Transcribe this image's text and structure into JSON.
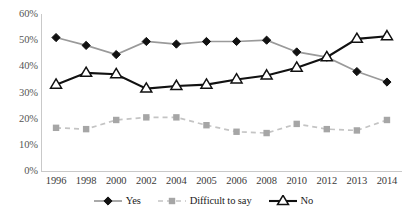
{
  "chart_data": {
    "type": "line",
    "title": "",
    "xlabel": "",
    "ylabel": "",
    "grid": false,
    "legend_position": "bottom",
    "ylim": [
      0,
      60
    ],
    "ytick_labels": [
      "0%",
      "10%",
      "20%",
      "30%",
      "40%",
      "50%",
      "60%"
    ],
    "ytick_values": [
      0,
      10,
      20,
      30,
      40,
      50,
      60
    ],
    "categories": [
      "1996",
      "1998",
      "2000",
      "2002",
      "2004",
      "2005",
      "2006",
      "2008",
      "2010",
      "2012",
      "2013",
      "2014"
    ],
    "series": [
      {
        "name": "Yes",
        "marker": "diamond",
        "marker_fill": "#111111",
        "line_color": "#9a9a9a",
        "values": [
          51,
          48,
          44.5,
          49.5,
          48.5,
          49.5,
          49.5,
          50,
          45.5,
          43.5,
          38,
          34
        ]
      },
      {
        "name": "Difficult to say",
        "marker": "square",
        "marker_fill": "#a6a6a6",
        "line_color": "#c4c4c4",
        "line_style": "dashed",
        "values": [
          16.5,
          16,
          19.5,
          20.5,
          20.5,
          17.5,
          15,
          14.5,
          18,
          16,
          15.5,
          19.5
        ]
      },
      {
        "name": "No",
        "marker": "triangle",
        "marker_fill": "#ffffff",
        "marker_stroke": "#111111",
        "line_color": "#111111",
        "values": [
          33,
          37.5,
          37,
          31.5,
          32.5,
          33,
          35,
          36.5,
          39.5,
          43.5,
          50.5,
          51.5
        ]
      }
    ]
  },
  "legend": {
    "items": [
      {
        "label": "Yes"
      },
      {
        "label": "Difficult to say"
      },
      {
        "label": "No"
      }
    ]
  },
  "caption": {
    "text": ""
  }
}
